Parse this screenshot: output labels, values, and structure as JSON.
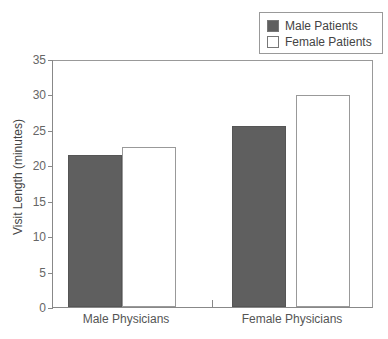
{
  "chart_data": {
    "type": "bar",
    "title": "",
    "xlabel": "",
    "ylabel": "Visit Length (minutes)",
    "ylim": [
      0,
      35
    ],
    "yticks": [
      0,
      5,
      10,
      15,
      20,
      25,
      30,
      35
    ],
    "categories": [
      "Male Physicians",
      "Female Physicians"
    ],
    "series": [
      {
        "name": "Male Patients",
        "color": "#5f5f5f",
        "values": [
          21.4,
          25.5
        ]
      },
      {
        "name": "Female Patients",
        "color": "#ffffff",
        "values": [
          22.6,
          29.9
        ]
      }
    ],
    "legend_position": "top-right",
    "grid": false
  },
  "legend": {
    "items": [
      "Male Patients",
      "Female Patients"
    ]
  },
  "axis": {
    "ylabel": "Visit Length (minutes)",
    "ticks": [
      "0",
      "5",
      "10",
      "15",
      "20",
      "25",
      "30",
      "35"
    ],
    "categories": [
      "Male Physicians",
      "Female Physicians"
    ]
  }
}
